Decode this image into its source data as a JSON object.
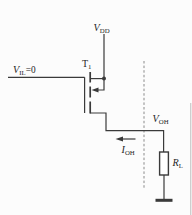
{
  "figure": {
    "kind": "transistor-output-high-level-circuit-schematic",
    "colors": {
      "ink": "#3a3a3a",
      "text": "#1f1f1f",
      "boundary_dash": "#8a8a8a",
      "background": "#fcfcfc",
      "resistor_fill": "#ffffff",
      "edge_artifact": "#cccccc"
    },
    "labels": {
      "supply": {
        "main": "V",
        "sub": "DD"
      },
      "transistor": {
        "main": "T",
        "sub": "1"
      },
      "input": {
        "main": "V",
        "sub": "IL",
        "suffix": "=0"
      },
      "output_voltage": {
        "main": "V",
        "sub": "OH"
      },
      "output_current": {
        "main": "I",
        "sub": "OH"
      },
      "load_resistor": {
        "main": "R",
        "sub": "L"
      }
    },
    "annotations": {
      "output_current_arrow_direction": "left",
      "substrate_arrow_direction": "left-into-channel",
      "boundary_line_style": "vertical-dashed"
    }
  }
}
